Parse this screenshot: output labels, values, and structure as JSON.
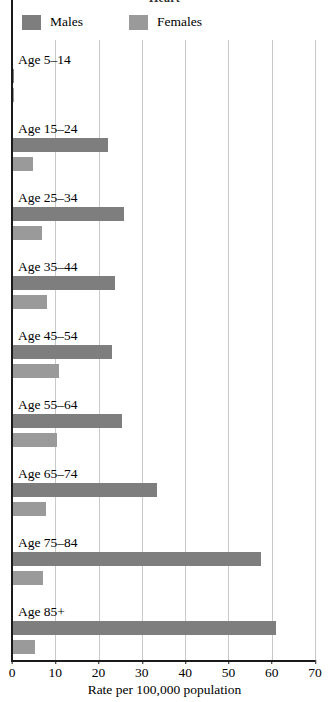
{
  "chart_data": {
    "type": "bar",
    "orientation": "horizontal",
    "title": "Heart",
    "xlabel": "Rate per 100,000 population",
    "ylabel": "",
    "xlim": [
      0,
      70
    ],
    "xticks": [
      0,
      10,
      20,
      30,
      40,
      50,
      60,
      70
    ],
    "xtick_labels": [
      "0",
      "10",
      "20",
      "30",
      "40",
      "50",
      "60",
      "70"
    ],
    "grid": true,
    "legend_position": "top-left",
    "categories": [
      "Age 5–14",
      "Age 15–24",
      "Age 25–34",
      "Age 35–44",
      "Age 45–54",
      "Age 55–64",
      "Age 65–74",
      "Age 75–84",
      "Age 85+"
    ],
    "series": [
      {
        "name": "Males",
        "color": "#7e7e7e",
        "values": [
          0.5,
          22.2,
          25.9,
          23.8,
          23.0,
          25.4,
          33.5,
          57.6,
          60.9
        ]
      },
      {
        "name": "Females",
        "color": "#9a9a9a",
        "values": [
          0.4,
          4.8,
          6.9,
          8.1,
          10.9,
          10.4,
          7.9,
          7.2,
          5.4
        ]
      }
    ]
  },
  "legend": {
    "items": [
      {
        "label": "Males",
        "color": "#7e7e7e"
      },
      {
        "label": "Females",
        "color": "#9a9a9a"
      }
    ]
  },
  "axis": {
    "x_label": "Rate per 100,000 population"
  }
}
